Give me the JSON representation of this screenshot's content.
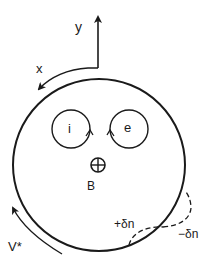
{
  "diagram": {
    "colors": {
      "stroke": "#1a1a1a",
      "background": "#ffffff"
    },
    "axes": {
      "y_label": "y",
      "x_label": "x"
    },
    "plasma_column": {
      "center": [
        99,
        165
      ],
      "radius": 86
    },
    "orbits": [
      {
        "label": "i",
        "center": [
          71,
          129
        ],
        "radius": 19,
        "species": "ion"
      },
      {
        "label": "e",
        "center": [
          129,
          129
        ],
        "radius": 19,
        "species": "electron"
      }
    ],
    "magnetic_field": {
      "symbol": "⊕",
      "label": "B"
    },
    "drift_velocity": {
      "label": "V*"
    },
    "perturbation": {
      "plus_label": "+δn",
      "minus_label": "−δn"
    }
  }
}
